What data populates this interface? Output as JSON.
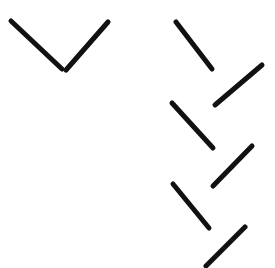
{
  "canvas": {
    "width": 275,
    "height": 268,
    "background_color": "#ffffff",
    "title": "Abstract line stroke figure"
  },
  "style": {
    "stroke_color": "#111111",
    "stroke_width": 5,
    "line_cap": "round"
  },
  "groups": [
    {
      "name": "left-chevron",
      "label": "Left V chevron",
      "stroke_count": 2
    },
    {
      "name": "right-zigzag",
      "label": "Right descending zigzag",
      "stroke_count": 5
    }
  ],
  "strokes": [
    {
      "id": "stroke-1",
      "group": "left-chevron",
      "role": "left-arm-descending",
      "x1": 11,
      "y1": 21,
      "x2": 62,
      "y2": 69,
      "color": "#111111",
      "width": 5
    },
    {
      "id": "stroke-2",
      "group": "left-chevron",
      "role": "right-arm-ascending",
      "x1": 66,
      "y1": 70,
      "x2": 108,
      "y2": 22,
      "color": "#111111",
      "width": 5
    },
    {
      "id": "stroke-3",
      "group": "right-zigzag",
      "role": "descending-1",
      "x1": 176,
      "y1": 22,
      "x2": 212,
      "y2": 69,
      "color": "#111111",
      "width": 5
    },
    {
      "id": "stroke-4",
      "group": "right-zigzag",
      "role": "ascending-1",
      "x1": 215,
      "y1": 105,
      "x2": 262,
      "y2": 65,
      "color": "#111111",
      "width": 5
    },
    {
      "id": "stroke-5",
      "group": "right-zigzag",
      "role": "descending-2",
      "x1": 172,
      "y1": 103,
      "x2": 213,
      "y2": 148,
      "color": "#111111",
      "width": 5
    },
    {
      "id": "stroke-6",
      "group": "right-zigzag",
      "role": "ascending-2",
      "x1": 213,
      "y1": 186,
      "x2": 252,
      "y2": 146,
      "color": "#111111",
      "width": 5
    },
    {
      "id": "stroke-7",
      "group": "right-zigzag",
      "role": "descending-3",
      "x1": 173,
      "y1": 184,
      "x2": 209,
      "y2": 228,
      "color": "#111111",
      "width": 5
    },
    {
      "id": "stroke-8",
      "group": "right-zigzag",
      "role": "ascending-3",
      "x1": 206,
      "y1": 266,
      "x2": 245,
      "y2": 227,
      "color": "#111111",
      "width": 5
    }
  ]
}
